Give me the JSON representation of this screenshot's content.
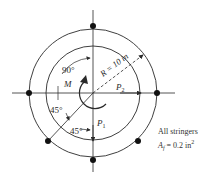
{
  "diagram": {
    "type": "cross-section",
    "labels": {
      "angle_top": "90°",
      "angle_mid": "45°",
      "angle_bottom": "45°",
      "moment": "M",
      "radius": "R = 10 in",
      "load_p2": "P",
      "load_p2_sub": "2",
      "load_p1": "P",
      "load_p1_sub": "1"
    },
    "note": {
      "line1": "All stringers",
      "line2_prefix": "A",
      "line2_sub": "f",
      "line2_value": " = 0.2 in",
      "line2_sup": "2"
    },
    "stringers": [
      {
        "position": "top",
        "angle_deg": 90
      },
      {
        "position": "left",
        "angle_deg": 180
      },
      {
        "position": "right",
        "angle_deg": 0
      },
      {
        "position": "bottom",
        "angle_deg": 270
      },
      {
        "position": "lower-left",
        "angle_deg": 225
      },
      {
        "position": "lower-right",
        "angle_deg": 315
      }
    ],
    "colors": {
      "line": "#2a2a2a",
      "background": "#ffffff"
    }
  }
}
